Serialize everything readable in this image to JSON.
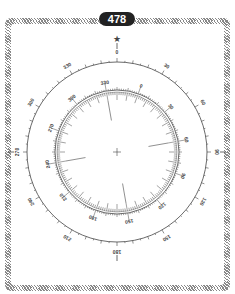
{
  "badge": {
    "number": "478"
  },
  "compass": {
    "center": [
      117,
      152
    ],
    "outer_radius": 90,
    "inner_radius": 62,
    "outer_labels": [
      "0",
      "30",
      "60",
      "90",
      "120",
      "150",
      "180",
      "210",
      "240",
      "270",
      "300",
      "330"
    ],
    "inner_labels": [
      "330",
      "0",
      "30",
      "60",
      "90",
      "120",
      "150",
      "180",
      "210",
      "240",
      "270",
      "300"
    ],
    "inner_rotation_deg": -20,
    "north_marker": "star-icon",
    "center_marker": "crosshair"
  },
  "colors": {
    "ink": "#444444",
    "badge_bg": "#222222",
    "border": "#888888"
  }
}
